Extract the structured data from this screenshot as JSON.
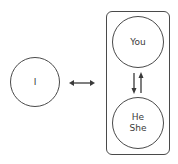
{
  "diagram": {
    "left_node": {
      "label": "I"
    },
    "group": {
      "top_node": {
        "label": "You"
      },
      "bottom_node": {
        "line1": "He",
        "line2": "She"
      }
    },
    "connectors": {
      "horizontal": "bidirectional-arrow",
      "vertical": "down-up-arrows"
    },
    "colors": {
      "stroke": "#4a4a4a",
      "text": "#3a3a3a",
      "background": "#ffffff"
    }
  }
}
